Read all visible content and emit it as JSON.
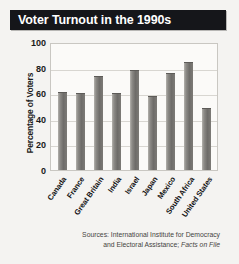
{
  "title": "Voter Turnout in the 1990s",
  "source": {
    "line1": "Sources: International Institute for Democracy",
    "line2_prefix": "and Electoral Assistance; ",
    "line2_italic": "Facts on File"
  },
  "colors": {
    "title_bar": "#15161a",
    "title_text": "#ffffff",
    "bar_fill": "#7e7c78",
    "plot_background": "#fbfaf8",
    "gridline": "#d8d6d1",
    "page_background": "#f4f3f1"
  },
  "chart_data": {
    "type": "bar",
    "title": "Voter Turnout in the 1990s",
    "xlabel": "",
    "ylabel": "Percentage of Voters",
    "ylim": [
      0,
      100
    ],
    "yticks": [
      100,
      80,
      60,
      40,
      20,
      0
    ],
    "grid": true,
    "legend": "none",
    "categories": [
      "Canada",
      "France",
      "Great Britain",
      "India",
      "Israel",
      "Japan",
      "Mexico",
      "South Africa",
      "United States"
    ],
    "values": [
      62,
      61,
      75,
      61,
      79,
      59,
      77,
      86,
      49
    ]
  }
}
